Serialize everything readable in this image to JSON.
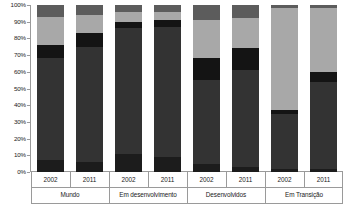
{
  "chart_data": {
    "type": "bar",
    "subtype": "stacked-percentage",
    "title": "",
    "xlabel": "",
    "ylabel": "",
    "ylim": [
      0,
      100
    ],
    "y_unit": "%",
    "grid": false,
    "legend_position": "none",
    "y_ticks": [
      "0%",
      "10%",
      "20%",
      "30%",
      "40%",
      "50%",
      "60%",
      "70%",
      "80%",
      "90%",
      "100%"
    ],
    "y_tick_values": [
      0,
      10,
      20,
      30,
      40,
      50,
      60,
      70,
      80,
      90,
      100
    ],
    "groups": [
      "Mundo",
      "Em desenvolvimento",
      "Desenvolvidos",
      "Em Transição"
    ],
    "categories": [
      "2002",
      "2011",
      "2002",
      "2011",
      "2002",
      "2011",
      "2002",
      "2011"
    ],
    "series": [
      {
        "name": "segment-1",
        "color": "#1c1c1c",
        "values": [
          7,
          6,
          11,
          9,
          5,
          3,
          2,
          2
        ]
      },
      {
        "name": "segment-2",
        "color": "#333333",
        "values": [
          61,
          69,
          75,
          78,
          50,
          58,
          33,
          52
        ]
      },
      {
        "name": "segment-3",
        "color": "#141414",
        "values": [
          8,
          8,
          4,
          4,
          13,
          13,
          2,
          6
        ]
      },
      {
        "name": "segment-4",
        "color": "#a8a8a8",
        "values": [
          17,
          11,
          6,
          5,
          23,
          18,
          61,
          38
        ]
      },
      {
        "name": "segment-5",
        "color": "#5c5c5c",
        "values": [
          7,
          6,
          4,
          4,
          9,
          8,
          2,
          2
        ]
      }
    ],
    "bars": [
      {
        "group": "Mundo",
        "year": "2002",
        "segments": [
          {
            "name": "segment-1",
            "from": 0,
            "to": 7,
            "value": 7,
            "color": "#1c1c1c"
          },
          {
            "name": "segment-2",
            "from": 7,
            "to": 68,
            "value": 61,
            "color": "#333333"
          },
          {
            "name": "segment-3",
            "from": 68,
            "to": 76,
            "value": 8,
            "color": "#141414"
          },
          {
            "name": "segment-4",
            "from": 76,
            "to": 93,
            "value": 17,
            "color": "#a8a8a8"
          },
          {
            "name": "segment-5",
            "from": 93,
            "to": 100,
            "value": 7,
            "color": "#5c5c5c"
          }
        ]
      },
      {
        "group": "Mundo",
        "year": "2011",
        "segments": [
          {
            "name": "segment-1",
            "from": 0,
            "to": 6,
            "value": 6,
            "color": "#1c1c1c"
          },
          {
            "name": "segment-2",
            "from": 6,
            "to": 75,
            "value": 69,
            "color": "#333333"
          },
          {
            "name": "segment-3",
            "from": 75,
            "to": 83,
            "value": 8,
            "color": "#141414"
          },
          {
            "name": "segment-4",
            "from": 83,
            "to": 94,
            "value": 11,
            "color": "#a8a8a8"
          },
          {
            "name": "segment-5",
            "from": 94,
            "to": 100,
            "value": 6,
            "color": "#5c5c5c"
          }
        ]
      },
      {
        "group": "Em desenvolvimento",
        "year": "2002",
        "segments": [
          {
            "name": "segment-1",
            "from": 0,
            "to": 11,
            "value": 11,
            "color": "#1c1c1c"
          },
          {
            "name": "segment-2",
            "from": 11,
            "to": 86,
            "value": 75,
            "color": "#333333"
          },
          {
            "name": "segment-3",
            "from": 86,
            "to": 90,
            "value": 4,
            "color": "#141414"
          },
          {
            "name": "segment-4",
            "from": 90,
            "to": 96,
            "value": 6,
            "color": "#a8a8a8"
          },
          {
            "name": "segment-5",
            "from": 96,
            "to": 100,
            "value": 4,
            "color": "#5c5c5c"
          }
        ]
      },
      {
        "group": "Em desenvolvimento",
        "year": "2011",
        "segments": [
          {
            "name": "segment-1",
            "from": 0,
            "to": 9,
            "value": 9,
            "color": "#1c1c1c"
          },
          {
            "name": "segment-2",
            "from": 9,
            "to": 87,
            "value": 78,
            "color": "#333333"
          },
          {
            "name": "segment-3",
            "from": 87,
            "to": 91,
            "value": 4,
            "color": "#141414"
          },
          {
            "name": "segment-4",
            "from": 91,
            "to": 96,
            "value": 5,
            "color": "#a8a8a8"
          },
          {
            "name": "segment-5",
            "from": 96,
            "to": 100,
            "value": 4,
            "color": "#5c5c5c"
          }
        ]
      },
      {
        "group": "Desenvolvidos",
        "year": "2002",
        "segments": [
          {
            "name": "segment-1",
            "from": 0,
            "to": 5,
            "value": 5,
            "color": "#1c1c1c"
          },
          {
            "name": "segment-2",
            "from": 5,
            "to": 55,
            "value": 50,
            "color": "#333333"
          },
          {
            "name": "segment-3",
            "from": 55,
            "to": 68,
            "value": 13,
            "color": "#141414"
          },
          {
            "name": "segment-4",
            "from": 68,
            "to": 91,
            "value": 23,
            "color": "#a8a8a8"
          },
          {
            "name": "segment-5",
            "from": 91,
            "to": 100,
            "value": 9,
            "color": "#5c5c5c"
          }
        ]
      },
      {
        "group": "Desenvolvidos",
        "year": "2011",
        "segments": [
          {
            "name": "segment-1",
            "from": 0,
            "to": 3,
            "value": 3,
            "color": "#1c1c1c"
          },
          {
            "name": "segment-2",
            "from": 3,
            "to": 61,
            "value": 58,
            "color": "#333333"
          },
          {
            "name": "segment-3",
            "from": 61,
            "to": 74,
            "value": 13,
            "color": "#141414"
          },
          {
            "name": "segment-4",
            "from": 74,
            "to": 92,
            "value": 18,
            "color": "#a8a8a8"
          },
          {
            "name": "segment-5",
            "from": 92,
            "to": 100,
            "value": 8,
            "color": "#5c5c5c"
          }
        ]
      },
      {
        "group": "Em Transição",
        "year": "2002",
        "segments": [
          {
            "name": "segment-1",
            "from": 0,
            "to": 2,
            "value": 2,
            "color": "#1c1c1c"
          },
          {
            "name": "segment-2",
            "from": 2,
            "to": 35,
            "value": 33,
            "color": "#333333"
          },
          {
            "name": "segment-3",
            "from": 35,
            "to": 37,
            "value": 2,
            "color": "#141414"
          },
          {
            "name": "segment-4",
            "from": 37,
            "to": 98,
            "value": 61,
            "color": "#a8a8a8"
          },
          {
            "name": "segment-5",
            "from": 98,
            "to": 100,
            "value": 2,
            "color": "#5c5c5c"
          }
        ]
      },
      {
        "group": "Em Transição",
        "year": "2011",
        "segments": [
          {
            "name": "segment-1",
            "from": 0,
            "to": 2,
            "value": 2,
            "color": "#1c1c1c"
          },
          {
            "name": "segment-2",
            "from": 2,
            "to": 54,
            "value": 52,
            "color": "#333333"
          },
          {
            "name": "segment-3",
            "from": 54,
            "to": 60,
            "value": 6,
            "color": "#141414"
          },
          {
            "name": "segment-4",
            "from": 60,
            "to": 98,
            "value": 38,
            "color": "#a8a8a8"
          },
          {
            "name": "segment-5",
            "from": 98,
            "to": 100,
            "value": 2,
            "color": "#5c5c5c"
          }
        ]
      }
    ]
  },
  "axis": {
    "line_color": "#9a9a9a"
  }
}
